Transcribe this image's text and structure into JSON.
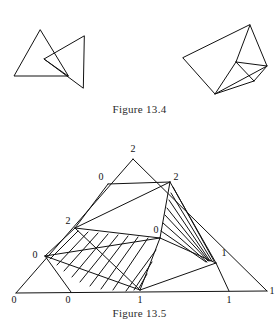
{
  "document": {
    "type": "textbook-figure-page",
    "background_color": "#ffffff",
    "ink_color": "#111111"
  },
  "figures": [
    {
      "id": "figure-13-4",
      "caption": "Figure 13.4",
      "description": "Two line drawings: a pair of overlapping triangles on the left, and a tilted quadrilateral subdivided into triangles on the right.",
      "panels": [
        {
          "id": "figure-13-4-left",
          "name": "overlapping-triangles",
          "shapes": [
            {
              "name": "triangle-a",
              "points": "40,30 14,76 68,76"
            },
            {
              "name": "triangle-b",
              "points": "84,36 44,59 83,88"
            },
            {
              "name": "chord",
              "points": "44,59 68,76"
            }
          ]
        },
        {
          "id": "figure-13-4-right",
          "name": "subdivided-quadrilateral",
          "shapes": [
            {
              "name": "outer-quad",
              "points": "250,25 267,66 215,94 183,58"
            },
            {
              "name": "inner-edge-apex-to-center",
              "points": "250,25 236,62"
            },
            {
              "name": "inner-edge-center-to-right",
              "points": "236,62 267,66"
            },
            {
              "name": "inner-edge-center-to-bottom",
              "points": "236,62 215,94"
            },
            {
              "name": "inner-edge-center-to-small",
              "points": "236,62 254,81"
            },
            {
              "name": "inner-edge-small-to-right",
              "points": "254,81 267,66"
            },
            {
              "name": "inner-edge-small-to-bottom",
              "points": "254,81 215,94"
            }
          ]
        }
      ]
    },
    {
      "id": "figure-13-5",
      "caption": "Figure 13.5",
      "description": "A Sperner-labelled triangulation of a large triangle. Vertices carry labels 0, 1 and 2. Two bands of triangles are hatched with parallel line shading.",
      "vertex_labels": [
        {
          "name": "apex-2",
          "text": "2",
          "x": 133,
          "y": 152
        },
        {
          "name": "upper-left-0",
          "text": "0",
          "x": 101,
          "y": 180
        },
        {
          "name": "upper-right-2",
          "text": "2",
          "x": 176,
          "y": 180
        },
        {
          "name": "mid-left-2",
          "text": "2",
          "x": 68,
          "y": 224
        },
        {
          "name": "mid-center-0",
          "text": "0",
          "x": 156,
          "y": 233
        },
        {
          "name": "left-0",
          "text": "0",
          "x": 35,
          "y": 258
        },
        {
          "name": "right-1",
          "text": "1",
          "x": 224,
          "y": 256
        },
        {
          "name": "base-left-0",
          "text": "0",
          "x": 14,
          "y": 299
        },
        {
          "name": "base-mid-left-0",
          "text": "0",
          "x": 64,
          "y": 299
        },
        {
          "name": "base-center-1",
          "text": "1",
          "x": 140,
          "y": 299
        },
        {
          "name": "base-right-1",
          "text": "1",
          "x": 229,
          "y": 299
        },
        {
          "name": "base-corner-1",
          "text": "1",
          "x": 266,
          "y": 294
        }
      ],
      "edges": [
        {
          "name": "outer-left-edge",
          "points": "133,159 16,293"
        },
        {
          "name": "outer-right-edge",
          "points": "133,159 267,291"
        },
        {
          "name": "outer-base-edge",
          "points": "16,293 267,291"
        },
        {
          "name": "edge-0-2-upper",
          "points": "108,184 170,182"
        },
        {
          "name": "edge-upper0-mid2",
          "points": "108,184 75,228"
        },
        {
          "name": "edge-upper2-mid2",
          "points": "170,182 75,228"
        },
        {
          "name": "edge-upper2-mid0",
          "points": "170,182 160,238"
        },
        {
          "name": "edge-upper2-right1",
          "points": "170,182 216,263"
        },
        {
          "name": "edge-mid0-right1",
          "points": "160,238 216,263"
        },
        {
          "name": "edge-mid2-mid0",
          "points": "75,228 160,238"
        },
        {
          "name": "edge-mid2-left0",
          "points": "75,228 45,256"
        },
        {
          "name": "edge-left0-base1",
          "points": "45,256 140,290"
        },
        {
          "name": "edge-mid0-base1",
          "points": "160,238 140,290"
        },
        {
          "name": "edge-left0-base0",
          "points": "45,256 71,292"
        },
        {
          "name": "edge-base1-right1",
          "points": "140,290 216,263"
        },
        {
          "name": "edge-right1-baseR",
          "points": "216,263 229,291"
        },
        {
          "name": "edge-left0-mid0",
          "points": "45,256 160,238"
        },
        {
          "name": "edge-mid2-base1",
          "points": "75,228 140,290"
        }
      ],
      "hatched_regions": [
        {
          "name": "left-hatch-band",
          "description": "fan of parallel strokes between the 2-labelled mid-left vertex, the 0-labelled left vertex, the central 0 vertex and the base 1 vertex",
          "stroke_count": 11
        },
        {
          "name": "right-hatch-band",
          "description": "fan of parallel strokes between the upper-right 2 vertex, the central 0 vertex and the right 1 vertex",
          "stroke_count": 7
        }
      ]
    }
  ]
}
